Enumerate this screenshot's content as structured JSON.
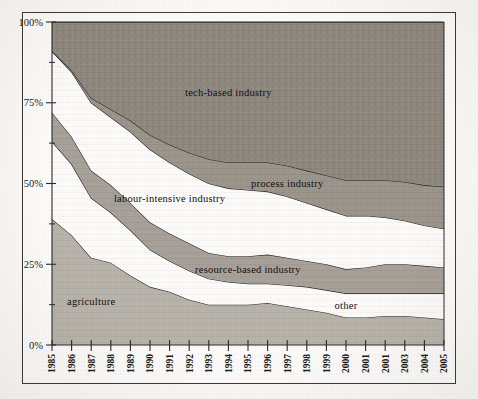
{
  "figure": {
    "background_color": "#fbfaf7",
    "frame_color": "#3a3a3a"
  },
  "axes": {
    "y_ticks": [
      "0%",
      "25%",
      "50%",
      "75%",
      "100%"
    ],
    "y_tick_values": [
      0,
      25,
      50,
      75,
      100
    ],
    "y_minor_ticks": [
      12.5,
      37.5,
      62.5,
      87.5
    ],
    "x_ticks": [
      "1985",
      "1986",
      "1987",
      "1988",
      "1989",
      "1990",
      "1991",
      "1992",
      "1993",
      "1994",
      "1995",
      "1996",
      "1997",
      "1998",
      "1999",
      "2000",
      "2001",
      "2001",
      "2003",
      "2004",
      "2005"
    ]
  },
  "chart_data": {
    "type": "area",
    "title": "",
    "xlabel": "",
    "ylabel": "",
    "ylim": [
      0,
      100
    ],
    "grid": false,
    "legend_position": "inline-labels",
    "stacked": true,
    "percent": true,
    "x": [
      "1985",
      "1986",
      "1987",
      "1988",
      "1989",
      "1990",
      "1991",
      "1992",
      "1993",
      "1994",
      "1995",
      "1996",
      "1997",
      "1998",
      "1999",
      "2000",
      "2001",
      "2001",
      "2003",
      "2004",
      "2005"
    ],
    "series": [
      {
        "name": "agriculture",
        "fill": "#b9b4ab",
        "label_x": "1987",
        "values": [
          39,
          34,
          27,
          25.5,
          21.5,
          18,
          16.5,
          14,
          12.5,
          12.5,
          12.5,
          13,
          12,
          11,
          10,
          8.5,
          8.5,
          9,
          9,
          8.5,
          8
        ]
      },
      {
        "name": "other",
        "fill": "#fdfcfa",
        "label_x": "2000",
        "values": [
          24,
          22,
          18.5,
          15.5,
          14,
          11.5,
          9.5,
          9,
          8,
          7,
          6.5,
          6,
          6.5,
          7,
          7,
          7.5,
          7.5,
          7,
          7,
          7.5,
          8
        ]
      },
      {
        "name": "resource-based industry",
        "fill": "#a8a29a",
        "label_x": "1995",
        "values": [
          9,
          8.5,
          8.5,
          8.5,
          8.5,
          8.5,
          8.5,
          8.5,
          8,
          8,
          8.5,
          9,
          8.5,
          8,
          8,
          7.5,
          8,
          9,
          9,
          8.5,
          8
        ]
      },
      {
        "name": "labour-intensive industry",
        "fill": "#fdfcfa",
        "label_x": "1991",
        "values": [
          19,
          20,
          21,
          21,
          22,
          22.5,
          22,
          21.5,
          21.5,
          21,
          20.5,
          19.5,
          19,
          18,
          17,
          16.5,
          16,
          14.5,
          13.5,
          12.5,
          12
        ]
      },
      {
        "name": "process industry",
        "fill": "#9c968d",
        "label_x": "1997",
        "values": [
          0,
          0.5,
          1.5,
          2.5,
          3.5,
          4.5,
          5.5,
          6.5,
          7.5,
          8,
          8.5,
          9,
          9.5,
          10,
          10.5,
          11,
          11,
          11.5,
          12,
          12.5,
          13
        ]
      },
      {
        "name": "tech-based industry",
        "fill": "#8f8980",
        "label_x": "1994",
        "values": [
          9,
          15,
          23.5,
          27,
          30.5,
          35,
          38,
          40.5,
          42.5,
          43.5,
          43.5,
          43.5,
          44.5,
          46,
          47.5,
          49,
          49,
          49,
          49.5,
          50.5,
          51
        ]
      }
    ]
  }
}
